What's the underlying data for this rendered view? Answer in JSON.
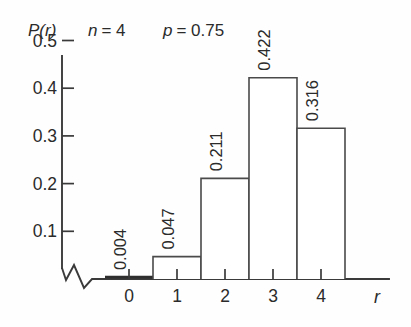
{
  "chart_data": {
    "type": "bar",
    "title": "",
    "subtitle": "",
    "xlabel": "r",
    "ylabel": "P(r)",
    "categories": [
      "0",
      "1",
      "2",
      "3",
      "4"
    ],
    "values": [
      0.004,
      0.047,
      0.211,
      0.422,
      0.316
    ],
    "value_labels": [
      "0.004",
      "0.047",
      "0.211",
      "0.422",
      "0.316"
    ],
    "series": [
      {
        "name": "P(r)",
        "values": [
          0.004,
          0.047,
          0.211,
          0.422,
          0.316
        ]
      }
    ],
    "ylim": [
      0,
      0.55
    ],
    "xlim": [
      -0.5,
      5.0
    ],
    "y_ticks": [
      0.1,
      0.2,
      0.3,
      0.4,
      0.5
    ],
    "y_tick_labels": [
      "0.1",
      "0.2",
      "0.3",
      "0.4",
      "0.5"
    ],
    "x_ticks": [
      0,
      1,
      2,
      3,
      4
    ],
    "x_tick_labels": [
      "0",
      "1",
      "2",
      "3",
      "4"
    ],
    "grid": false,
    "legend": false,
    "legend_position": "none",
    "bar_fill": "#ffffff",
    "bar_edge": "#4a4a4a",
    "axis_color": "#3a3a3a",
    "text_color": "#2b2b2b",
    "background": "#fefefe",
    "value_label_rotation": -90,
    "y_axis_break": true,
    "annotations": [
      {
        "name": "n",
        "text": "n = 4",
        "symbol": "n",
        "value": "4"
      },
      {
        "name": "p",
        "text": "p = 0.75",
        "symbol": "p",
        "value": "0.75"
      }
    ]
  },
  "figure": {
    "y_axis_label": "P(r)",
    "x_axis_label": "r",
    "param_n_symbol": "n",
    "param_n_eqval": "= 4",
    "param_p_symbol": "p",
    "param_p_eqval": "= 0.75",
    "y_tick_0": "0.1",
    "y_tick_1": "0.2",
    "y_tick_2": "0.3",
    "y_tick_3": "0.4",
    "y_tick_4": "0.5",
    "x_tick_0": "0",
    "x_tick_1": "1",
    "x_tick_2": "2",
    "x_tick_3": "3",
    "x_tick_4": "4",
    "bar_label_0": "0.004",
    "bar_label_1": "0.047",
    "bar_label_2": "0.211",
    "bar_label_3": "0.422",
    "bar_label_4": "0.316"
  }
}
